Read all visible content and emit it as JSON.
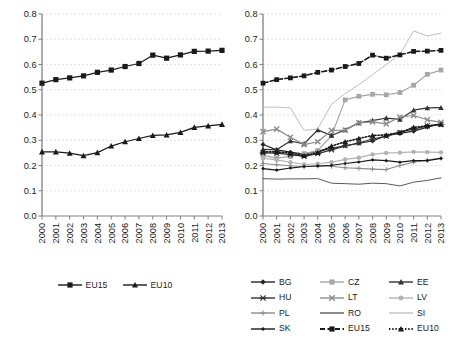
{
  "figure": {
    "background": "#ffffff",
    "panels": [
      "left",
      "right"
    ]
  },
  "chart_data": [
    {
      "type": "line",
      "panel": "left",
      "title": "",
      "xlabel": "",
      "ylabel": "",
      "categories": [
        "2000",
        "2001",
        "2002",
        "2003",
        "2004",
        "2005",
        "2006",
        "2007",
        "2008",
        "2009",
        "2010",
        "2011",
        "2012",
        "2013"
      ],
      "ylim": [
        0.0,
        0.8
      ],
      "yticks": [
        "0.0",
        "0.1",
        "0.2",
        "0.3",
        "0.4",
        "0.5",
        "0.6",
        "0.7",
        "0.8"
      ],
      "ytick_values": [
        0.0,
        0.1,
        0.2,
        0.3,
        0.4,
        0.5,
        0.6,
        0.7,
        0.8
      ],
      "grid": "horizontal-dashed",
      "legend_position": "bottom-center",
      "series": [
        {
          "name": "EU15",
          "marker": "square",
          "linestyle": "solid",
          "color": "#1a1a1a",
          "values": [
            0.526,
            0.54,
            0.547,
            0.555,
            0.569,
            0.578,
            0.592,
            0.604,
            0.637,
            0.625,
            0.638,
            0.652,
            0.653,
            0.656
          ]
        },
        {
          "name": "EU10",
          "marker": "triangle",
          "linestyle": "solid",
          "color": "#1a1a1a",
          "values": [
            0.254,
            0.254,
            0.249,
            0.239,
            0.251,
            0.277,
            0.294,
            0.307,
            0.319,
            0.321,
            0.331,
            0.351,
            0.357,
            0.363
          ]
        }
      ]
    },
    {
      "type": "line",
      "panel": "right",
      "title": "",
      "xlabel": "",
      "ylabel": "",
      "categories": [
        "2000",
        "2001",
        "2002",
        "2003",
        "2004",
        "2005",
        "2006",
        "2007",
        "2008",
        "2009",
        "2010",
        "2011",
        "2012",
        "2013"
      ],
      "ylim": [
        0.0,
        0.8
      ],
      "yticks": [
        "0.0",
        "0.1",
        "0.2",
        "0.3",
        "0.4",
        "0.5",
        "0.6",
        "0.7",
        "0.8"
      ],
      "ytick_values": [
        0.0,
        0.1,
        0.2,
        0.3,
        0.4,
        0.5,
        0.6,
        0.7,
        0.8
      ],
      "grid": "horizontal-dashed",
      "legend_position": "bottom",
      "series": [
        {
          "name": "BG",
          "marker": "diamond",
          "linestyle": "solid",
          "color": "#262626",
          "values": [
            0.283,
            0.262,
            0.253,
            0.245,
            0.257,
            0.268,
            0.278,
            0.288,
            0.297,
            0.318,
            0.327,
            0.336,
            0.352,
            0.366
          ]
        },
        {
          "name": "CZ",
          "marker": "square",
          "linestyle": "solid",
          "color": "#a6a6a6",
          "values": [
            0.24,
            0.229,
            0.236,
            0.247,
            0.259,
            0.318,
            0.46,
            0.474,
            0.482,
            0.48,
            0.489,
            0.518,
            0.561,
            0.578
          ]
        },
        {
          "name": "EE",
          "marker": "triangle",
          "linestyle": "solid",
          "color": "#333333",
          "values": [
            0.264,
            0.262,
            0.297,
            0.286,
            0.341,
            0.319,
            0.341,
            0.369,
            0.378,
            0.388,
            0.383,
            0.419,
            0.428,
            0.429
          ]
        },
        {
          "name": "HU",
          "marker": "x-bar",
          "linestyle": "solid",
          "color": "#333333",
          "values": [
            0.25,
            0.249,
            0.243,
            0.236,
            0.247,
            0.262,
            0.278,
            0.289,
            0.305,
            0.316,
            0.332,
            0.344,
            0.357,
            0.362
          ]
        },
        {
          "name": "LT",
          "marker": "x",
          "linestyle": "solid",
          "color": "#8c8c8c",
          "values": [
            0.334,
            0.344,
            0.312,
            0.283,
            0.294,
            0.339,
            0.34,
            0.369,
            0.373,
            0.365,
            0.392,
            0.398,
            0.381,
            0.371
          ]
        },
        {
          "name": "LV",
          "marker": "circle",
          "linestyle": "solid",
          "color": "#b3b3b3",
          "values": [
            0.229,
            0.222,
            0.213,
            0.204,
            0.207,
            0.213,
            0.224,
            0.231,
            0.244,
            0.25,
            0.251,
            0.254,
            0.253,
            0.252
          ]
        },
        {
          "name": "PL",
          "marker": "plus",
          "linestyle": "solid",
          "color": "#8c8c8c",
          "values": [
            0.208,
            0.203,
            0.199,
            0.195,
            0.198,
            0.197,
            0.191,
            0.189,
            0.186,
            0.184,
            0.2,
            0.213,
            0.221,
            0.229
          ]
        },
        {
          "name": "RO",
          "marker": "none",
          "linestyle": "solid",
          "color": "#595959",
          "values": [
            0.148,
            0.146,
            0.147,
            0.147,
            0.148,
            0.13,
            0.128,
            0.126,
            0.13,
            0.128,
            0.119,
            0.134,
            0.141,
            0.151
          ]
        },
        {
          "name": "SI",
          "marker": "none",
          "linestyle": "solid",
          "color": "#c0c0c0",
          "values": [
            0.431,
            0.431,
            0.428,
            0.339,
            0.345,
            0.442,
            0.485,
            0.52,
            0.56,
            0.6,
            0.64,
            0.733,
            0.713,
            0.724
          ]
        },
        {
          "name": "SK",
          "marker": "diamond-small",
          "linestyle": "solid",
          "color": "#1a1a1a",
          "values": [
            0.188,
            0.182,
            0.19,
            0.196,
            0.198,
            0.201,
            0.208,
            0.214,
            0.222,
            0.219,
            0.213,
            0.219,
            0.219,
            0.228
          ]
        },
        {
          "name": "EU15",
          "marker": "square",
          "linestyle": "dashed",
          "color": "#1a1a1a",
          "values": [
            0.526,
            0.54,
            0.547,
            0.555,
            0.569,
            0.578,
            0.592,
            0.604,
            0.637,
            0.625,
            0.638,
            0.652,
            0.653,
            0.656
          ]
        },
        {
          "name": "EU10",
          "marker": "triangle",
          "linestyle": "dotted",
          "color": "#1a1a1a",
          "values": [
            0.254,
            0.254,
            0.249,
            0.239,
            0.251,
            0.277,
            0.294,
            0.307,
            0.319,
            0.321,
            0.331,
            0.351,
            0.357,
            0.363
          ]
        }
      ]
    }
  ],
  "legend_left": {
    "items": [
      {
        "label": "EU15",
        "marker": "square",
        "linestyle": "solid",
        "color": "#1a1a1a"
      },
      {
        "label": "EU10",
        "marker": "triangle",
        "linestyle": "solid",
        "color": "#1a1a1a"
      }
    ]
  },
  "legend_right": {
    "items": [
      {
        "label": "BG",
        "marker": "diamond",
        "linestyle": "solid",
        "color": "#262626"
      },
      {
        "label": "CZ",
        "marker": "square",
        "linestyle": "solid",
        "color": "#a6a6a6"
      },
      {
        "label": "EE",
        "marker": "triangle",
        "linestyle": "solid",
        "color": "#333333"
      },
      {
        "label": "HU",
        "marker": "x-bar",
        "linestyle": "solid",
        "color": "#333333"
      },
      {
        "label": "LT",
        "marker": "x",
        "linestyle": "solid",
        "color": "#8c8c8c"
      },
      {
        "label": "LV",
        "marker": "circle",
        "linestyle": "solid",
        "color": "#b3b3b3"
      },
      {
        "label": "PL",
        "marker": "plus",
        "linestyle": "solid",
        "color": "#8c8c8c"
      },
      {
        "label": "RO",
        "marker": "none",
        "linestyle": "solid",
        "color": "#595959"
      },
      {
        "label": "SI",
        "marker": "none",
        "linestyle": "solid",
        "color": "#c0c0c0"
      },
      {
        "label": "SK",
        "marker": "diamond-small",
        "linestyle": "solid",
        "color": "#1a1a1a"
      },
      {
        "label": "EU15",
        "marker": "square",
        "linestyle": "dashed",
        "color": "#1a1a1a"
      },
      {
        "label": "EU10",
        "marker": "triangle",
        "linestyle": "dotted",
        "color": "#1a1a1a"
      }
    ]
  },
  "axis_style": {
    "axis_color": "#808080",
    "grid_color": "#e0dcdc",
    "tick_label_color": "#1a1a1a"
  }
}
